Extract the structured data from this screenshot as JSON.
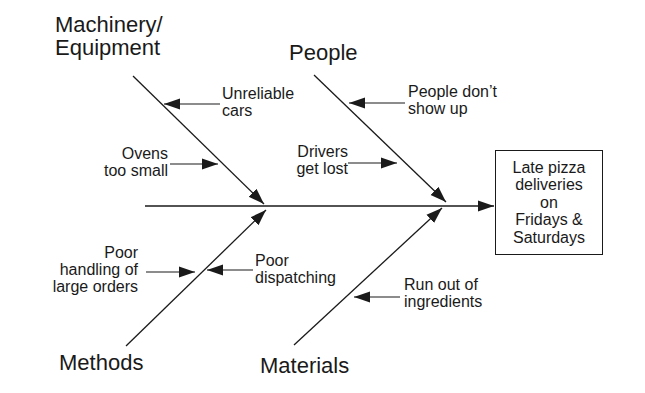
{
  "diagram": {
    "type": "fishbone",
    "effect": "Late pizza\ndeliveries\non\nFridays &\nSaturdays",
    "categories": {
      "machinery": {
        "label_line1": "Machinery/",
        "label_line2": "Equipment",
        "causes": [
          {
            "line1": "Unreliable",
            "line2": "cars"
          },
          {
            "line1": "Ovens",
            "line2": "too small"
          }
        ]
      },
      "people": {
        "label": "People",
        "causes": [
          {
            "line1": "People don’t",
            "line2": "show up"
          },
          {
            "line1": "Drivers",
            "line2": "get lost"
          }
        ]
      },
      "methods": {
        "label": "Methods",
        "causes": [
          {
            "line1": "Poor",
            "line2": "handling of",
            "line3": "large orders"
          },
          {
            "line1": "Poor",
            "line2": "dispatching"
          }
        ]
      },
      "materials": {
        "label": "Materials",
        "causes": [
          {
            "line1": "Run out of",
            "line2": "ingredients"
          }
        ]
      }
    },
    "colors": {
      "line": "#1a1a1a",
      "background": "#ffffff"
    }
  }
}
